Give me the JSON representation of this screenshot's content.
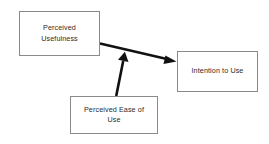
{
  "diagram": {
    "background_color": "#ffffff",
    "box_border_color": "#8a8a8a",
    "arrow_color": "#000000",
    "text_color": "#2b2b2b",
    "nodes": [
      {
        "id": "perceived-usefulness",
        "label": "Perceived\nUsefulness",
        "x": 19,
        "y": 11,
        "width": 81,
        "height": 45
      },
      {
        "id": "intention-to-use",
        "label": "Intention to Use",
        "x": 177,
        "y": 51,
        "width": 81,
        "height": 41
      },
      {
        "id": "perceived-ease-of-use",
        "label": "Perceived Ease of\nUse",
        "x": 70,
        "y": 96,
        "width": 88,
        "height": 38
      }
    ],
    "edges": [
      {
        "id": "usefulness-to-intention",
        "from": "perceived-usefulness",
        "to": "intention-to-use",
        "from_point": [
          100,
          44
        ],
        "to_point": [
          177,
          62
        ],
        "arrowhead": "end",
        "direction": "right-down"
      },
      {
        "id": "ease-to-usefulness-link",
        "from": "perceived-ease-of-use",
        "to": "usefulness-to-intention",
        "from_point": [
          116,
          96
        ],
        "to_point": [
          125,
          52
        ],
        "arrowhead": "end",
        "direction": "up-right"
      }
    ]
  }
}
